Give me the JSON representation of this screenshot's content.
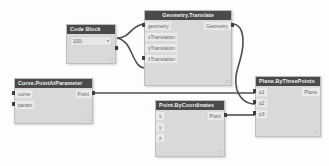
{
  "canvas": {
    "background": "#fdfdfd",
    "wire_color": "#4e4e4e",
    "header_color": "#4a4a4a",
    "node_body_color": "#d9d9d9"
  },
  "nodes": {
    "code_block": {
      "title": "Code Block",
      "value": "100;",
      "caret": "▾",
      "grip": "∷"
    },
    "geometry_translate": {
      "title": "Geometry.Translate",
      "inputs": [
        {
          "label": "geometry"
        },
        {
          "label": "xTranslation"
        },
        {
          "label": "yTranslation"
        },
        {
          "label": "zTranslation"
        }
      ],
      "outputs": [
        {
          "label": "Geometry"
        }
      ],
      "grip": "∷"
    },
    "curve_point_at_parameter": {
      "title": "Curve.PointAtParameter",
      "inputs": [
        {
          "label": "curve"
        },
        {
          "label": "param"
        }
      ],
      "outputs": [
        {
          "label": "Point"
        }
      ],
      "grip": "∷"
    },
    "point_by_coordinates": {
      "title": "Point.ByCoordinates",
      "inputs": [
        {
          "label": "x"
        },
        {
          "label": "y"
        },
        {
          "label": "z"
        }
      ],
      "outputs": [
        {
          "label": "Point"
        }
      ],
      "grip": "∷"
    },
    "plane_by_three_points": {
      "title": "Plane.ByThreePoints",
      "inputs": [
        {
          "label": "p1"
        },
        {
          "label": "p2"
        },
        {
          "label": "p3"
        }
      ],
      "outputs": [
        {
          "label": "Plane"
        }
      ],
      "grip": "∷"
    }
  },
  "connections": [
    {
      "from": "code_block.output",
      "to": "geometry_translate.geometry"
    },
    {
      "from": "code_block.output",
      "to": "geometry_translate.zTranslation"
    },
    {
      "from": "curve_point_at_parameter.Point",
      "to": "plane_by_three_points.p1"
    },
    {
      "from": "geometry_translate.Geometry",
      "to": "plane_by_three_points.p2"
    },
    {
      "from": "point_by_coordinates.Point",
      "to": "plane_by_three_points.p3"
    }
  ]
}
